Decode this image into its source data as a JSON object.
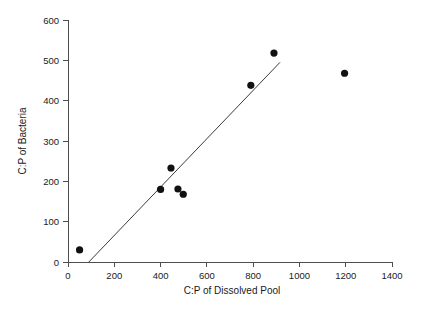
{
  "chart_data": {
    "type": "scatter",
    "title": "",
    "xlabel": "C:P of Dissolved Pool",
    "ylabel": "C:P of Bacteria",
    "xlim": [
      0,
      1400
    ],
    "ylim": [
      0,
      600
    ],
    "xticks": [
      0,
      200,
      400,
      600,
      800,
      1000,
      1200,
      1400
    ],
    "yticks": [
      0,
      100,
      200,
      300,
      400,
      500,
      600
    ],
    "xtick_labels": [
      "0",
      "200",
      "400",
      "600",
      "800",
      "1000",
      "1200",
      "1400"
    ],
    "ytick_labels": [
      "0",
      "100",
      "200",
      "300",
      "400",
      "500",
      "600"
    ],
    "grid": false,
    "legend": false,
    "marker": "filled-circle",
    "marker_color": "#111111",
    "points": [
      {
        "x": 50,
        "y": 30
      },
      {
        "x": 400,
        "y": 180
      },
      {
        "x": 445,
        "y": 233
      },
      {
        "x": 475,
        "y": 181
      },
      {
        "x": 498,
        "y": 168
      },
      {
        "x": 790,
        "y": 438
      },
      {
        "x": 890,
        "y": 518
      },
      {
        "x": 1195,
        "y": 468
      }
    ],
    "trend_line": {
      "type": "linear-fit",
      "x_start": 90,
      "y_start": 0,
      "x_end": 916,
      "y_end": 495,
      "color": "#3a3a3a"
    },
    "axis_color": "#4d4d4d",
    "background": "#ffffff"
  }
}
